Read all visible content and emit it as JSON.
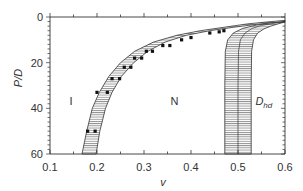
{
  "chart_data": {
    "type": "line",
    "title": "",
    "xlabel": "v",
    "ylabel": "P/D",
    "xlim": [
      0.1,
      0.6
    ],
    "ylim": [
      0,
      60
    ],
    "y_inverted": true,
    "x_ticks": [
      "0.1",
      "0.2",
      "0.3",
      "0.4",
      "0.5",
      "0.6"
    ],
    "x_tick_values": [
      0.1,
      0.2,
      0.3,
      0.4,
      0.5,
      0.6
    ],
    "y_ticks": [
      "0",
      "20",
      "40",
      "60"
    ],
    "y_tick_values": [
      0,
      20,
      40,
      60
    ],
    "grid": false,
    "region_labels": [
      {
        "text": "I",
        "x": 0.145,
        "y": 37
      },
      {
        "text": "N",
        "x": 0.365,
        "y": 37
      },
      {
        "text": "D",
        "sub": "hd",
        "x": 0.555,
        "y": 37
      }
    ],
    "series": [
      {
        "name": "I-N boundary band",
        "style": "hatched-band",
        "lower": [
          [
            0.168,
            60
          ],
          [
            0.178,
            50
          ],
          [
            0.19,
            40
          ],
          [
            0.205,
            33
          ],
          [
            0.225,
            26
          ],
          [
            0.25,
            20
          ],
          [
            0.28,
            15
          ],
          [
            0.32,
            11
          ],
          [
            0.37,
            8
          ],
          [
            0.42,
            6
          ],
          [
            0.47,
            4.5
          ],
          [
            0.52,
            3
          ],
          [
            0.57,
            2
          ],
          [
            0.6,
            1.5
          ]
        ],
        "upper": [
          [
            0.198,
            60
          ],
          [
            0.206,
            50
          ],
          [
            0.218,
            40
          ],
          [
            0.232,
            33
          ],
          [
            0.252,
            26
          ],
          [
            0.278,
            20
          ],
          [
            0.308,
            15
          ],
          [
            0.345,
            11
          ],
          [
            0.39,
            8
          ],
          [
            0.44,
            6
          ],
          [
            0.49,
            4.5
          ],
          [
            0.54,
            3.2
          ],
          [
            0.58,
            2.4
          ],
          [
            0.6,
            2
          ]
        ]
      },
      {
        "name": "N-Dhd boundary band",
        "style": "hatched-band",
        "lower": [
          [
            0.472,
            60
          ],
          [
            0.472,
            30
          ],
          [
            0.473,
            15
          ],
          [
            0.478,
            10
          ],
          [
            0.49,
            7
          ],
          [
            0.51,
            5
          ],
          [
            0.54,
            3.5
          ],
          [
            0.57,
            2.6
          ],
          [
            0.6,
            2
          ]
        ],
        "upper": [
          [
            0.528,
            60
          ],
          [
            0.528,
            30
          ],
          [
            0.529,
            15
          ],
          [
            0.533,
            10
          ],
          [
            0.542,
            7
          ],
          [
            0.555,
            5.2
          ],
          [
            0.57,
            4
          ],
          [
            0.585,
            3
          ],
          [
            0.6,
            2.2
          ]
        ],
        "center": [
          [
            0.5,
            60
          ],
          [
            0.5,
            30
          ],
          [
            0.501,
            15
          ],
          [
            0.505,
            10
          ],
          [
            0.515,
            7
          ],
          [
            0.53,
            5
          ],
          [
            0.55,
            3.7
          ],
          [
            0.575,
            2.8
          ],
          [
            0.6,
            2.1
          ]
        ]
      },
      {
        "name": "I-N data points",
        "style": "markers",
        "points": [
          [
            0.18,
            50
          ],
          [
            0.196,
            50
          ],
          [
            0.2,
            33
          ],
          [
            0.222,
            33
          ],
          [
            0.232,
            27
          ],
          [
            0.248,
            27
          ],
          [
            0.258,
            22
          ],
          [
            0.272,
            22
          ],
          [
            0.28,
            18
          ],
          [
            0.295,
            18
          ],
          [
            0.305,
            15
          ],
          [
            0.318,
            15
          ],
          [
            0.34,
            12.5
          ],
          [
            0.355,
            12.5
          ],
          [
            0.38,
            10
          ],
          [
            0.4,
            9
          ],
          [
            0.44,
            7
          ],
          [
            0.46,
            6.5
          ],
          [
            0.47,
            6
          ]
        ]
      }
    ]
  }
}
